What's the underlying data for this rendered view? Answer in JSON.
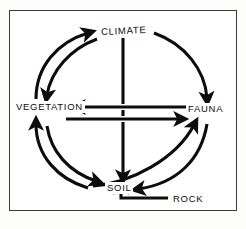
{
  "figure": {
    "kind": "cycle-diagram",
    "background_color": "#ffffff",
    "ink_color": "#0d0d0d",
    "frame_color": "#3b3b3b"
  },
  "nodes": {
    "climate": {
      "label": "CLIMATE",
      "position": "top"
    },
    "vegetation": {
      "label": "VEGETATION",
      "position": "left"
    },
    "fauna": {
      "label": "FAUNA",
      "position": "right"
    },
    "soil": {
      "label": "SOIL",
      "position": "bottom"
    },
    "rock": {
      "label": "ROCK",
      "position": "bottom-right"
    }
  },
  "arrows": [
    {
      "name": "vegetation-to-climate",
      "from": "VEGETATION",
      "to": "CLIMATE",
      "style": "curved"
    },
    {
      "name": "climate-to-vegetation",
      "from": "CLIMATE",
      "to": "VEGETATION",
      "style": "curved"
    },
    {
      "name": "climate-to-fauna",
      "from": "CLIMATE",
      "to": "FAUNA",
      "style": "curved"
    },
    {
      "name": "climate-to-soil",
      "from": "CLIMATE",
      "to": "SOIL",
      "style": "straight-vertical"
    },
    {
      "name": "fauna-to-vegetation",
      "from": "FAUNA",
      "to": "VEGETATION",
      "style": "straight-horizontal"
    },
    {
      "name": "vegetation-to-fauna",
      "from": "VEGETATION",
      "to": "FAUNA",
      "style": "straight-horizontal"
    },
    {
      "name": "vegetation-to-soil",
      "from": "VEGETATION",
      "to": "SOIL",
      "style": "curved"
    },
    {
      "name": "soil-to-vegetation",
      "from": "SOIL",
      "to": "VEGETATION",
      "style": "curved"
    },
    {
      "name": "soil-to-fauna",
      "from": "SOIL",
      "to": "FAUNA",
      "style": "curved"
    },
    {
      "name": "fauna-to-soil",
      "from": "FAUNA",
      "to": "SOIL",
      "style": "curved"
    },
    {
      "name": "rock-to-soil",
      "from": "ROCK",
      "to": "SOIL",
      "style": "elbow"
    }
  ]
}
